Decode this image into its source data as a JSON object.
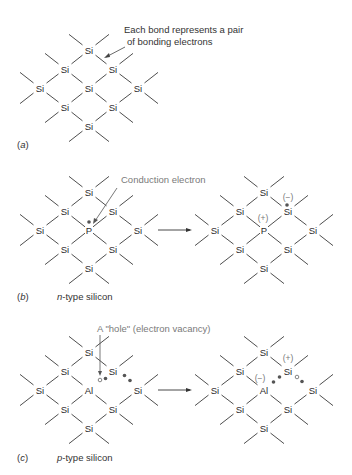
{
  "figure": {
    "panels": [
      {
        "id": "a",
        "label": "(a)",
        "label_letter": "a",
        "subtitle": "",
        "annotation": "Each bond represents a pair of bonding electrons",
        "annotation_lines": [
          "Each bond represents a pair",
          "of bonding electrons"
        ]
      },
      {
        "id": "b",
        "label": "(b)",
        "label_letter": "b",
        "subtitle_prefix": "n",
        "subtitle_rest": "-type silicon",
        "annotation": "Conduction electron",
        "dopant": "P",
        "charges": {
          "dopant": "(+)",
          "neighbor": "(−)"
        }
      },
      {
        "id": "c",
        "label": "(c)",
        "label_letter": "c",
        "subtitle_prefix": "p",
        "subtitle_rest": "-type silicon",
        "annotation": "A \"hole\" (electron vacancy)",
        "dopant": "Al",
        "charges": {
          "dopant": "(−)",
          "neighbor": "(+)"
        }
      }
    ],
    "atoms": {
      "si": "Si",
      "p": "P",
      "al": "Al"
    },
    "colors": {
      "bond": "#3a3a3a",
      "text": "#2a2a2a",
      "annotation_gray": "#7a7a7a",
      "electron": "#555555"
    }
  }
}
